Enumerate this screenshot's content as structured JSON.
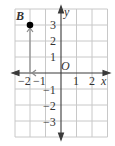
{
  "diagram": {
    "type": "coordinate-grid",
    "x_range": [
      -3,
      3
    ],
    "y_range": [
      -4,
      4
    ],
    "axis_labels": {
      "x": "x",
      "y": "y",
      "origin": "O"
    },
    "x_ticks": [
      {
        "value": -2,
        "label": "−2"
      },
      {
        "value": -1,
        "label": "−1"
      },
      {
        "value": 1,
        "label": "1"
      },
      {
        "value": 2,
        "label": "2"
      }
    ],
    "y_ticks": [
      {
        "value": 3,
        "label": "3"
      },
      {
        "value": 2,
        "label": "2"
      },
      {
        "value": 1,
        "label": "1"
      },
      {
        "value": -1,
        "label": "−1"
      },
      {
        "value": -2,
        "label": "−2"
      },
      {
        "value": -3,
        "label": "−3"
      }
    ],
    "point": {
      "label": "B",
      "x": -2,
      "y": 3
    },
    "path": [
      {
        "from": [
          0,
          0
        ],
        "to": [
          -2,
          0
        ],
        "description": "move left 2"
      },
      {
        "from": [
          -2,
          0
        ],
        "to": [
          -2,
          3
        ],
        "description": "move up 3"
      }
    ],
    "colors": {
      "grid": "#c8c8c8",
      "axis": "#3a3a3a",
      "path": "#8a8a8a",
      "point": "#000000"
    }
  }
}
